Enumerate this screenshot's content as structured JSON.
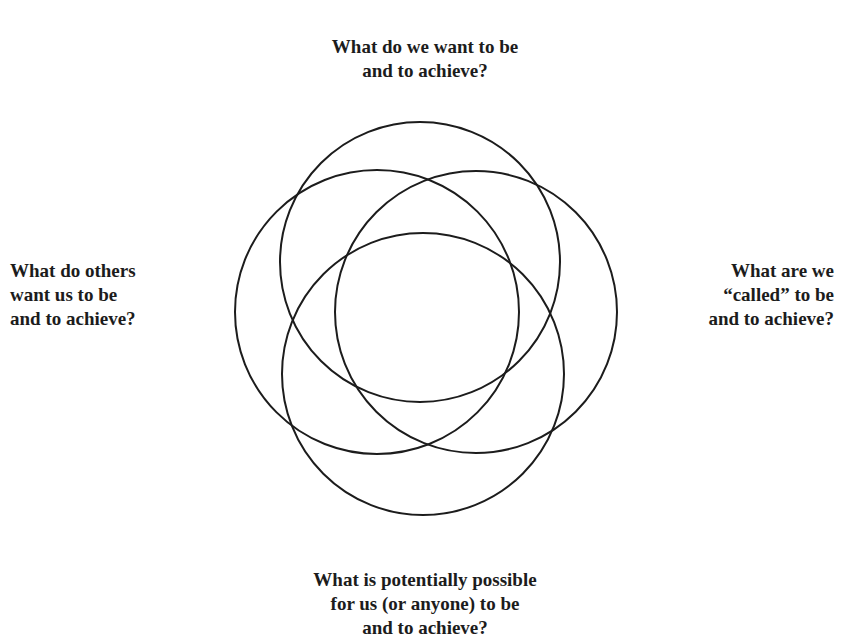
{
  "diagram": {
    "type": "four-circle-venn",
    "stroke_color": "#1c1c1c",
    "background_color": "#ffffff",
    "circles": [
      {
        "id": "top",
        "cx": 420,
        "cy": 262,
        "r": 140
      },
      {
        "id": "left",
        "cx": 377,
        "cy": 312,
        "r": 142
      },
      {
        "id": "right",
        "cx": 476,
        "cy": 312,
        "r": 141
      },
      {
        "id": "bottom",
        "cx": 423,
        "cy": 374,
        "r": 141
      }
    ],
    "labels": {
      "top": {
        "lines": [
          "What do we want to be",
          "and to achieve?"
        ]
      },
      "left": {
        "lines": [
          "What do others",
          "want us to be",
          "and to achieve?"
        ]
      },
      "right": {
        "lines": [
          "What are we",
          "“called” to be",
          "and to achieve?"
        ]
      },
      "bottom": {
        "lines": [
          "What is potentially possible",
          "for us (or anyone) to be",
          "and to achieve?"
        ]
      }
    }
  }
}
